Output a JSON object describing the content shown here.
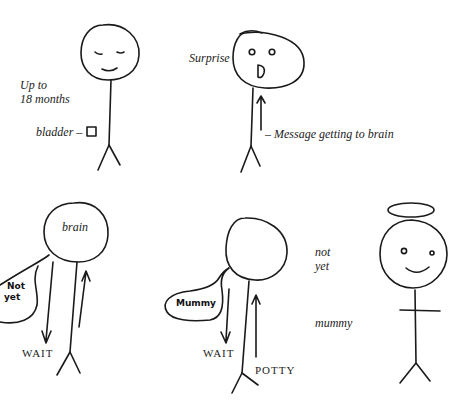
{
  "panels": {
    "baby": {
      "age_line1": "Up to",
      "age_line2": "18 months",
      "bladder_label": "bladder –",
      "face": "sleeping-smile"
    },
    "surprise": {
      "emotion_label": "Surprise",
      "arrow_label": "– Message getting to brain",
      "face": "surprised"
    },
    "brain_wait": {
      "head_label": "brain",
      "bubble_line1": "Not",
      "bubble_line2": "yet",
      "down_label": "WAIT"
    },
    "potty": {
      "bubble_text": "Mummy",
      "down_label": "WAIT",
      "up_label": "POTTY"
    },
    "angel": {
      "side_line1": "not",
      "side_line2": "yet",
      "side_bottom": "mummy",
      "face": "happy-with-halo"
    }
  },
  "colors": {
    "ink": "#1a1a1a",
    "paper": "#ffffff"
  }
}
